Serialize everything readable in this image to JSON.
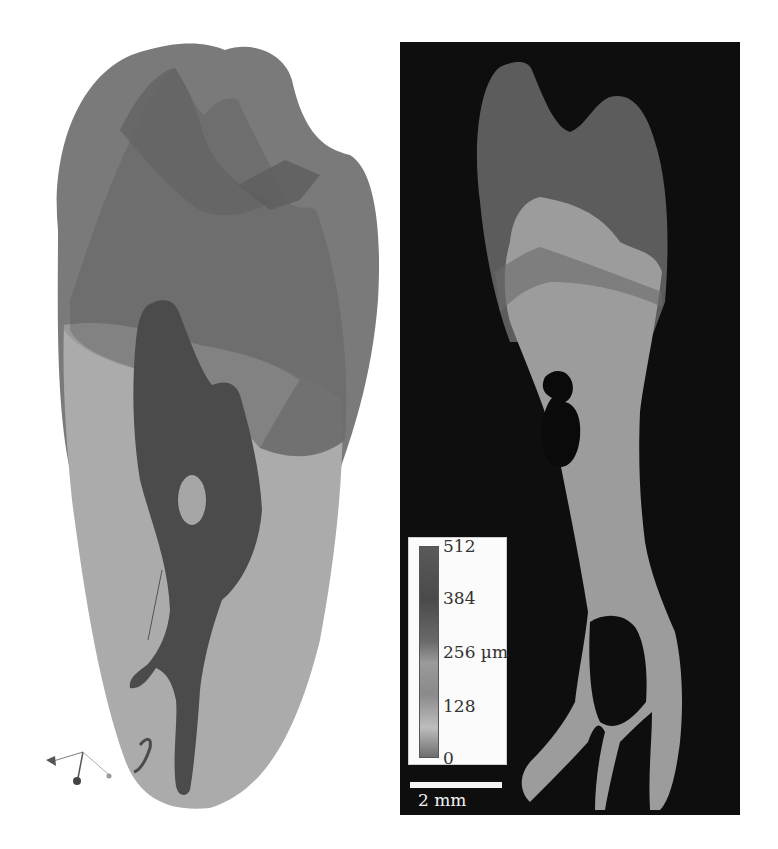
{
  "figure": {
    "left_panel": {
      "description": "3D rendering of tooth with pulp canal",
      "colors": {
        "enamel": "#7a7a7a",
        "dentin_upper": "#6c6c6c",
        "root_surface": "#a9a9a9",
        "pulp": "#4c4c4c",
        "background": "#ffffff"
      }
    },
    "right_panel": {
      "description": "Thickness map slice of tooth",
      "background": "#0e0e0e",
      "legend": {
        "title_unit": "µm",
        "ticks": [
          "512",
          "384",
          "256 µm",
          "128",
          "0"
        ]
      },
      "scale_bar": {
        "label": "2 mm"
      }
    }
  }
}
